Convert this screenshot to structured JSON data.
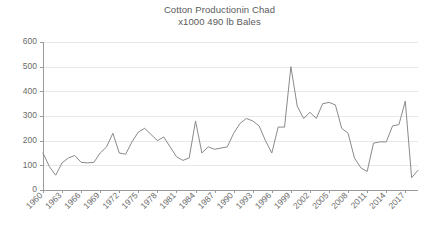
{
  "chart_data": {
    "type": "line",
    "title": "Cotton Productionin Chad",
    "subtitle": "x1000 490 lb Bales",
    "xlabel": "",
    "ylabel": "",
    "ylim": [
      0,
      600
    ],
    "y_ticks": [
      0,
      100,
      200,
      300,
      400,
      500,
      600
    ],
    "grid": true,
    "legend": "none",
    "x_tick_labels": [
      "1960",
      "1963",
      "1966",
      "1969",
      "1972",
      "1975",
      "1978",
      "1981",
      "1984",
      "1987",
      "1990",
      "1993",
      "1996",
      "1999",
      "2002",
      "2005",
      "2008",
      "2011",
      "2014",
      "2017"
    ],
    "x_tick_step": 3,
    "x": [
      1960,
      1961,
      1962,
      1963,
      1964,
      1965,
      1966,
      1967,
      1968,
      1969,
      1970,
      1971,
      1972,
      1973,
      1974,
      1975,
      1976,
      1977,
      1978,
      1979,
      1980,
      1981,
      1982,
      1983,
      1984,
      1985,
      1986,
      1987,
      1988,
      1989,
      1990,
      1991,
      1992,
      1993,
      1994,
      1995,
      1996,
      1997,
      1998,
      1999,
      2000,
      2001,
      2002,
      2003,
      2004,
      2005,
      2006,
      2007,
      2008,
      2009,
      2010,
      2011,
      2012,
      2013,
      2014,
      2015,
      2016,
      2017,
      2018,
      2019
    ],
    "values": [
      150,
      95,
      60,
      110,
      130,
      140,
      112,
      110,
      112,
      150,
      175,
      230,
      150,
      145,
      195,
      235,
      250,
      225,
      200,
      215,
      175,
      135,
      120,
      130,
      280,
      150,
      175,
      165,
      170,
      175,
      230,
      270,
      290,
      280,
      260,
      200,
      150,
      255,
      255,
      500,
      340,
      290,
      315,
      290,
      350,
      355,
      345,
      250,
      230,
      130,
      90,
      75,
      190,
      195,
      195,
      260,
      265,
      360,
      50,
      80
    ]
  },
  "plot_geometry": {
    "left": 43,
    "right": 418,
    "top": 42,
    "bottom": 190
  }
}
